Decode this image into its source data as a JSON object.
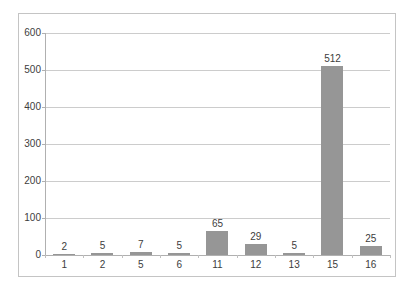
{
  "chart_data": {
    "type": "bar",
    "title": "",
    "subtitle": "",
    "xlabel": "",
    "ylabel": "",
    "categories": [
      "1",
      "2",
      "5",
      "6",
      "11",
      "12",
      "13",
      "15",
      "16"
    ],
    "values": [
      2,
      5,
      7,
      5,
      65,
      29,
      5,
      512,
      25
    ],
    "data_labels": [
      "2",
      "5",
      "7",
      "5",
      "65",
      "29",
      "5",
      "512",
      "25"
    ],
    "ylim": [
      0,
      600
    ],
    "ytick_labels": [
      "0",
      "100",
      "200",
      "300",
      "400",
      "500",
      "600"
    ],
    "ytick_values": [
      0,
      100,
      200,
      300,
      400,
      500,
      600
    ],
    "grid": true,
    "grid_axis": "y",
    "legend": false,
    "legend_position": "none",
    "series": [
      {
        "name": "",
        "values": [
          2,
          5,
          7,
          5,
          65,
          29,
          5,
          512,
          25
        ]
      }
    ],
    "colors": {
      "bar": "#969696",
      "gridline": "#cccccc",
      "axis": "#b0b0b0",
      "border": "#c4c4c4",
      "text": "#3d3d3d",
      "background": "#ffffff"
    }
  }
}
